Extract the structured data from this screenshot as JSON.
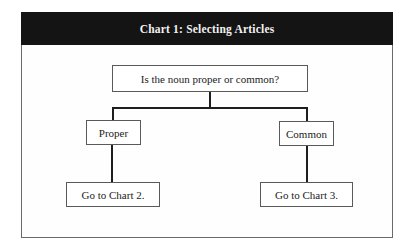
{
  "chart_title": "Chart 1: Selecting Articles",
  "nodes": {
    "question": "Is the noun proper or common?",
    "proper": "Proper",
    "common": "Common",
    "go_chart_2": "Go to Chart 2.",
    "go_chart_3": "Go to Chart 3."
  },
  "edges": [
    {
      "from": "question",
      "to": "proper"
    },
    {
      "from": "question",
      "to": "common"
    },
    {
      "from": "proper",
      "to": "go_chart_2"
    },
    {
      "from": "common",
      "to": "go_chart_3"
    }
  ],
  "colors": {
    "header_bg": "#141414",
    "header_text": "#f2f2f2",
    "border": "#5a5a5a",
    "connector": "#1e1e1e"
  }
}
